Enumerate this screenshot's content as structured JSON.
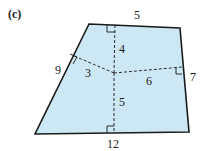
{
  "figure": {
    "part_label": "(c)",
    "fill_color": "#cde8f5",
    "stroke_color": "#1a1a1a",
    "shape": "quadrilateral",
    "side_labels": {
      "top": "5",
      "left": "9",
      "right": "7",
      "bottom": "12"
    },
    "perpendicular_labels": {
      "to_top": "4",
      "to_left": "3",
      "to_right": "6",
      "to_bottom": "5"
    }
  }
}
